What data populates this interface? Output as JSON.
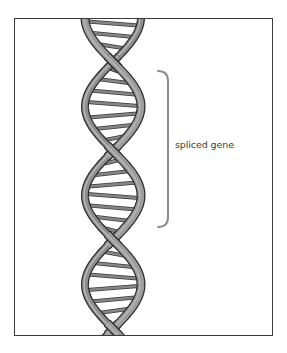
{
  "figure": {
    "annotation": {
      "label": "spliced gene",
      "bracket_top_y": 71,
      "bracket_bottom_y": 227
    }
  },
  "colors": {
    "frame": "#3a3a3a",
    "strand_fill": "#9c9c9c",
    "strand_outline": "#2e2e2e",
    "rung_fill": "#858585",
    "rung_outline": "#3a3a3a",
    "bracket": "#8c8c8c",
    "label": "#3c3c3c",
    "background": "#ffffff"
  }
}
